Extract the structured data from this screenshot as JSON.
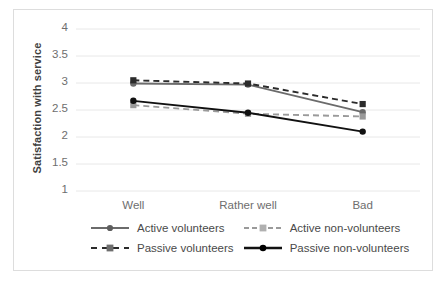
{
  "chart_data": {
    "type": "line",
    "title": "",
    "xlabel": "",
    "ylabel": "Satisfaction with service",
    "categories": [
      "Well",
      "Rather well",
      "Bad"
    ],
    "ylim": [
      1,
      4
    ],
    "ytick_labels": [
      "4",
      "3.5",
      "3",
      "2.5",
      "2",
      "1.5",
      "1"
    ],
    "ytick_values": [
      4,
      3.5,
      3,
      2.5,
      2,
      1.5,
      1
    ],
    "grid": true,
    "legend_position": "bottom",
    "series": [
      {
        "name": "Active volunteers",
        "values": [
          2.99,
          2.97,
          2.46
        ],
        "color": "#6b6b6b",
        "style": "solid",
        "marker": "circle"
      },
      {
        "name": "Active non-volunteers",
        "values": [
          2.59,
          2.43,
          2.38
        ],
        "color": "#9a9a9a",
        "style": "dashed",
        "marker": "square"
      },
      {
        "name": "Passive volunteers",
        "values": [
          3.05,
          2.99,
          2.61
        ],
        "color": "#2b2b2b",
        "style": "dashed",
        "marker": "square"
      },
      {
        "name": "Passive non-volunteers",
        "values": [
          2.67,
          2.45,
          2.1
        ],
        "color": "#111111",
        "style": "solid",
        "marker": "circle"
      }
    ]
  },
  "legend": {
    "items": [
      {
        "label": "Active volunteers"
      },
      {
        "label": "Active non-volunteers"
      },
      {
        "label": "Passive volunteers"
      },
      {
        "label": "Passive non-volunteers"
      }
    ]
  },
  "colors": {
    "gridline": "#e8e8e8",
    "frame_border": "#dddddd",
    "tick_text": "#6e6e6e",
    "axis_title": "#3f3f3f",
    "background": "#ffffff"
  }
}
